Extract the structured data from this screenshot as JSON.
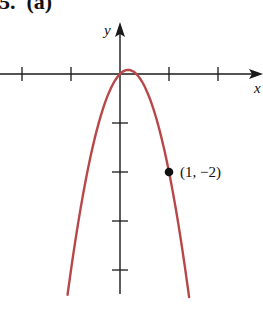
{
  "figure": {
    "label": "5.  (a)"
  },
  "chart_data": {
    "type": "line",
    "title": "",
    "panel_label": "5. (a)",
    "xlabel": "x",
    "ylabel": "y",
    "function": "y = -3x^2 + x",
    "shape": "downward-opening parabola",
    "vertex": [
      0.167,
      0.083
    ],
    "x_range_plotted": [
      -1.07,
      1.41
    ],
    "xlim": [
      -2.5,
      2.7
    ],
    "ylim": [
      -4.7,
      0.9
    ],
    "x_ticks": [
      -2,
      -1,
      1,
      2
    ],
    "y_ticks": [
      -1,
      -2,
      -3,
      -4
    ],
    "tick_labels_shown": false,
    "grid": false,
    "series": [
      {
        "name": "parabola",
        "color": "#b8474a",
        "x": [
          -1.07,
          -0.75,
          -0.5,
          -0.25,
          0,
          0.167,
          0.25,
          0.5,
          0.75,
          1,
          1.25,
          1.41
        ],
        "y": [
          -4.5,
          -2.44,
          -1.25,
          -0.44,
          0,
          0.083,
          0.06,
          -0.25,
          -0.94,
          -2,
          -3.44,
          -4.55
        ]
      }
    ],
    "annotations": [
      {
        "type": "point",
        "x": 1,
        "y": -2,
        "label": "(1, −2)",
        "color": "#111111"
      }
    ],
    "legend": null
  },
  "layout": {
    "origin_px": [
      120,
      74
    ],
    "unit_px": 49,
    "curve_color": "#b8474a",
    "axis_color": "#1a1a1a"
  }
}
